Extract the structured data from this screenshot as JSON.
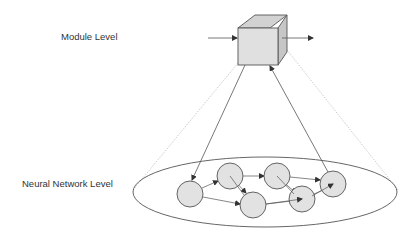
{
  "labels": {
    "module_level": "Module Level",
    "neural_network_level": "Neural Network Level"
  },
  "colors": {
    "stroke": "#555555",
    "node_fill": "#e2e2e2",
    "cube_front": "#e0e0e0",
    "cube_top": "#d0d0d0",
    "cube_side": "#c4c4c4",
    "dotted": "#b8b8b8",
    "text": "#333333"
  },
  "module": {
    "shape": "cube",
    "inputs": 1,
    "outputs": 1
  },
  "network": {
    "nodes": [
      {
        "id": "n1",
        "cx": 190,
        "cy": 194,
        "r": 13
      },
      {
        "id": "n2",
        "cx": 230,
        "cy": 176,
        "r": 13
      },
      {
        "id": "n3",
        "cx": 253,
        "cy": 205,
        "r": 13
      },
      {
        "id": "n4",
        "cx": 277,
        "cy": 176,
        "r": 13
      },
      {
        "id": "n5",
        "cx": 302,
        "cy": 199,
        "r": 13
      },
      {
        "id": "n6",
        "cx": 333,
        "cy": 184,
        "r": 13
      }
    ],
    "edges": [
      {
        "from": "n1",
        "to": "n2"
      },
      {
        "from": "n1",
        "to": "n3"
      },
      {
        "from": "n2",
        "to": "n3"
      },
      {
        "from": "n2",
        "to": "n4"
      },
      {
        "from": "n3",
        "to": "n5"
      },
      {
        "from": "n4",
        "to": "n5"
      },
      {
        "from": "n4",
        "to": "n6"
      },
      {
        "from": "n5",
        "to": "n6"
      }
    ]
  },
  "inter_level_links": [
    {
      "from": "module",
      "to": "n1",
      "direction": "down"
    },
    {
      "from": "n6",
      "to": "module",
      "direction": "up"
    }
  ]
}
